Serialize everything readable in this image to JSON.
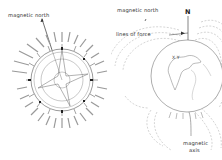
{
  "figure": {
    "left": {
      "title": "compass rose",
      "label_magnetic_north": "magnetic north",
      "tick_labels": [
        "N",
        "NbE",
        "NNE",
        "NEbN",
        "NE",
        "NEbE",
        "ENE",
        "EbN",
        "E",
        "EbS",
        "ESE",
        "SEbE",
        "SE",
        "SEbS",
        "SSE",
        "SbE",
        "S",
        "SbW",
        "SSW",
        "SWbS",
        "SW",
        "SWbW",
        "WSW",
        "WbS",
        "W",
        "WbN",
        "WNW",
        "NWbW",
        "NW",
        "NWbN",
        "NNW",
        "NbW"
      ]
    },
    "right": {
      "title": "earth magnetic field",
      "label_magnetic_north": "magnetic north",
      "label_N": "N",
      "label_lines_of_force": "lines of force",
      "label_magnetic_axis_line1": "magnetic",
      "label_magnetic_axis_line2": "axis",
      "pole_marker": "X Y"
    },
    "colors": {
      "ink": "#333333",
      "light_ink": "#999999",
      "background": "#ffffff"
    }
  }
}
